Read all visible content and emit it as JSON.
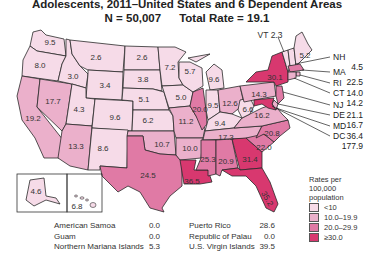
{
  "title": {
    "line1": "Adolescents, 2011–United States and 6 Dependent Areas",
    "n_label": "N = 50,007",
    "total_rate_label": "Total Rate = 19.1"
  },
  "colors": {
    "lt10": "#f6dbe8",
    "r10_19": "#ebb0cb",
    "r20_29": "#e07aa5",
    "ge30": "#d8386f"
  },
  "states": [
    {
      "abbr": "WA",
      "rate": "9.5"
    },
    {
      "abbr": "OR",
      "rate": "8.0"
    },
    {
      "abbr": "CA",
      "rate": "19.2"
    },
    {
      "abbr": "NV",
      "rate": "17.7"
    },
    {
      "abbr": "ID",
      "rate": "3.0"
    },
    {
      "abbr": "MT",
      "rate": "2.6"
    },
    {
      "abbr": "WY",
      "rate": "3.4"
    },
    {
      "abbr": "UT",
      "rate": "4.3"
    },
    {
      "abbr": "AZ",
      "rate": "13.3"
    },
    {
      "abbr": "CO",
      "rate": "9.6"
    },
    {
      "abbr": "NM",
      "rate": "8.6"
    },
    {
      "abbr": "ND",
      "rate": "2.6"
    },
    {
      "abbr": "SD",
      "rate": "3.8"
    },
    {
      "abbr": "NE",
      "rate": "5.1"
    },
    {
      "abbr": "KS",
      "rate": "6.2"
    },
    {
      "abbr": "OK",
      "rate": "10.7"
    },
    {
      "abbr": "TX",
      "rate": "24.5"
    },
    {
      "abbr": "MN",
      "rate": "7.2"
    },
    {
      "abbr": "IA",
      "rate": "5.0"
    },
    {
      "abbr": "MO",
      "rate": "11.2"
    },
    {
      "abbr": "AR",
      "rate": "10.0"
    },
    {
      "abbr": "LA",
      "rate": "36.5"
    },
    {
      "abbr": "WI",
      "rate": "5.7"
    },
    {
      "abbr": "IL",
      "rate": "20.0"
    },
    {
      "abbr": "MI",
      "rate": "9.6"
    },
    {
      "abbr": "IN",
      "rate": "9.5"
    },
    {
      "abbr": "OH",
      "rate": "12.6"
    },
    {
      "abbr": "KY",
      "rate": "9.4"
    },
    {
      "abbr": "TN",
      "rate": "17.3"
    },
    {
      "abbr": "MS",
      "rate": "25.3"
    },
    {
      "abbr": "AL",
      "rate": "20.9"
    },
    {
      "abbr": "GA",
      "rate": "31.4"
    },
    {
      "abbr": "FL",
      "rate": "35.2"
    },
    {
      "abbr": "SC",
      "rate": "22.0"
    },
    {
      "abbr": "NC",
      "rate": "20.8"
    },
    {
      "abbr": "VA",
      "rate": "16.2"
    },
    {
      "abbr": "WV",
      "rate": "6.6"
    },
    {
      "abbr": "PA",
      "rate": "14.3"
    },
    {
      "abbr": "NY",
      "rate": "30.1"
    },
    {
      "abbr": "ME",
      "rate": "5.2"
    },
    {
      "abbr": "VT",
      "rate": "2.3"
    },
    {
      "abbr": "AK",
      "rate": "4.6"
    },
    {
      "abbr": "HI",
      "rate": "6.8"
    }
  ],
  "callouts": [
    {
      "abbr": "NH",
      "rate": "4.5"
    },
    {
      "abbr": "MA",
      "rate": "22.5"
    },
    {
      "abbr": "RI",
      "rate": "14.0"
    },
    {
      "abbr": "CT",
      "rate": "14.2"
    },
    {
      "abbr": "NJ",
      "rate": "21.1"
    },
    {
      "abbr": "DE",
      "rate": "16.7"
    },
    {
      "abbr": "MD",
      "rate": "36.4"
    },
    {
      "abbr": "DC",
      "rate": "177.9"
    }
  ],
  "vt_callout": {
    "abbr": "VT",
    "rate": "2.3"
  },
  "legend": {
    "title_line1": "Rates per",
    "title_line2": "100,000",
    "title_line3": "population",
    "items": [
      {
        "label": "<10",
        "color": "#f6dbe8"
      },
      {
        "label": "10.0–19.9",
        "color": "#ebb0cb"
      },
      {
        "label": "20.0–29.9",
        "color": "#e07aa5"
      },
      {
        "label": "≥30.0",
        "color": "#d8386f"
      }
    ]
  },
  "territories_left": [
    {
      "name": "American Samoa",
      "rate": "0.0"
    },
    {
      "name": "Guam",
      "rate": "0.0"
    },
    {
      "name": "Northern Mariana Islands",
      "rate": "5.3"
    }
  ],
  "territories_right": [
    {
      "name": "Puerto Rico",
      "rate": "28.6"
    },
    {
      "name": "Republic of Palau",
      "rate": "0.0"
    },
    {
      "name": "U.S. Virgin Islands",
      "rate": "39.5"
    }
  ]
}
